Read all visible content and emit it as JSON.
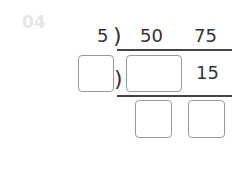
{
  "problem_label": "04",
  "divisor": "5",
  "dividends": [
    "50",
    "75"
  ],
  "quotient_row": [
    "15"
  ],
  "bracket": ")",
  "blanks": {
    "divisor_blank": "",
    "quotient_blank": "",
    "result_blank_1": "",
    "result_blank_2": ""
  }
}
